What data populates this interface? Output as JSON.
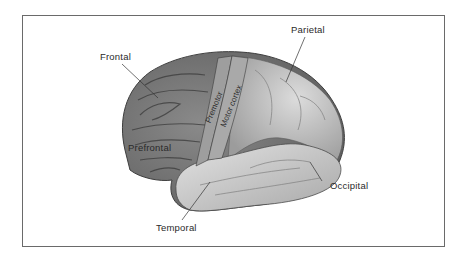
{
  "figure": {
    "type": "lateral view of cerebral cortex illustration",
    "labels": {
      "frontal": "Frontal",
      "parietal": "Parietal",
      "premotor": "Premotor",
      "motor_cortex": "Motor cortex",
      "prefrontal": "Prefrontal",
      "occipital": "Occipital",
      "temporal": "Temporal"
    },
    "colors": {
      "frame": "#6a6a6a",
      "text": "#2a2a2a",
      "brain_dark": "#6e6e6e",
      "brain_mid": "#9a9a9a",
      "brain_light": "#d6d6d6"
    }
  }
}
